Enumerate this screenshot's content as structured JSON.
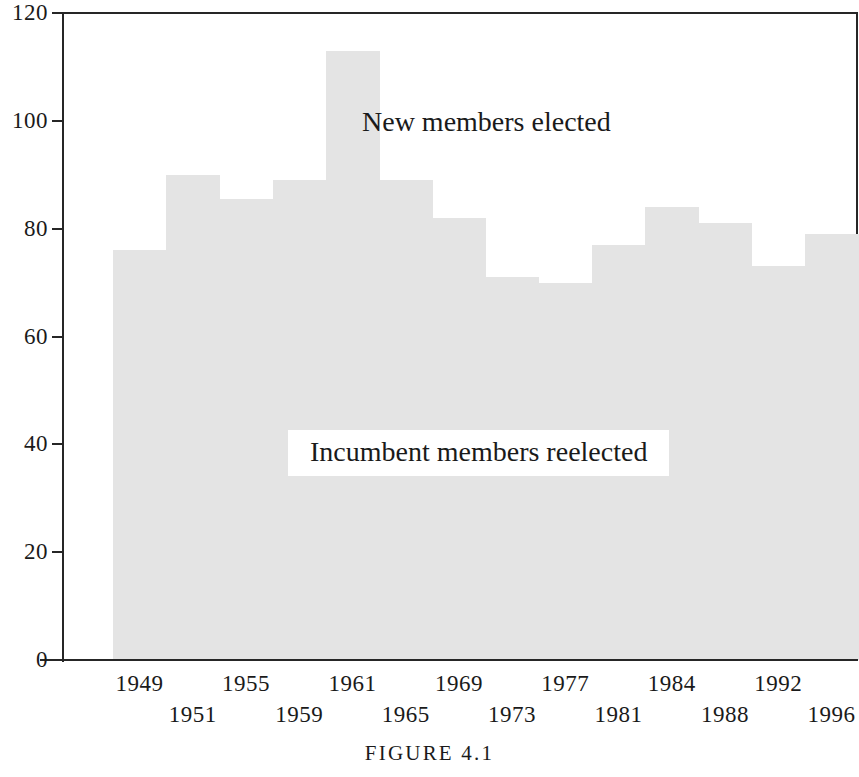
{
  "caption": "FIGURE 4.1",
  "annotations": {
    "upper": "New members elected",
    "lower": "Incumbent members reelected"
  },
  "colors": {
    "bar_fill": "#e4e4e4",
    "axis": "#262626",
    "text": "#1a1a1a",
    "background": "#ffffff"
  },
  "chart_data": {
    "type": "bar",
    "title": "FIGURE 4.1",
    "xlabel": "",
    "ylabel": "",
    "ylim": [
      0,
      120
    ],
    "yticks": [
      0,
      20,
      40,
      60,
      80,
      100,
      120
    ],
    "ytick_labels": [
      "0",
      "20",
      "40",
      "60",
      "80",
      "100",
      "120"
    ],
    "grid": false,
    "legend": "inline-annotations",
    "series_name": "New members elected",
    "baseline_series_name": "Incumbent members reelected",
    "categories": [
      "1949",
      "1951",
      "1955",
      "1959",
      "1961",
      "1965",
      "1969",
      "1973",
      "1977",
      "1981",
      "1984",
      "1988",
      "1992",
      "1996"
    ],
    "values": [
      76,
      90,
      85.5,
      89,
      113,
      89,
      82,
      71,
      70,
      77,
      84,
      81,
      73,
      79
    ],
    "xtick_rows": {
      "upper": [
        "1949",
        "1955",
        "1961",
        "1969",
        "1977",
        "1984",
        "1992"
      ],
      "lower": [
        "1951",
        "1959",
        "1965",
        "1973",
        "1981",
        "1988",
        "1996"
      ]
    }
  }
}
